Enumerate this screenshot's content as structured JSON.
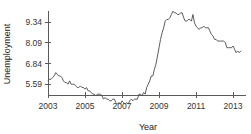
{
  "chart_data": {
    "type": "line",
    "title": "",
    "xlabel": "Year",
    "ylabel": "Unemployment",
    "xlim": [
      2003.0,
      2013.7
    ],
    "ylim": [
      4.95,
      9.95
    ],
    "grid": false,
    "legend": "none",
    "line_color": "#4a4a4a",
    "axis_color": "#5a5a5a",
    "background_color": "#ffffff",
    "y_ticks": [
      5.59,
      6.84,
      8.09,
      9.34
    ],
    "y_tick_labels": [
      "5.59",
      "6.84",
      "8.09",
      "9.34"
    ],
    "x_ticks": [
      2003,
      2005,
      2007,
      2009,
      2011,
      2013
    ],
    "x_tick_labels": [
      "2003",
      "2005",
      "2007",
      "2009",
      "2011",
      "2013"
    ],
    "series": [
      {
        "name": "Unemployment",
        "x": [
          2003.0,
          2003.083,
          2003.167,
          2003.25,
          2003.333,
          2003.417,
          2003.5,
          2003.583,
          2003.667,
          2003.75,
          2003.833,
          2003.917,
          2004.0,
          2004.083,
          2004.167,
          2004.25,
          2004.333,
          2004.417,
          2004.5,
          2004.583,
          2004.667,
          2004.75,
          2004.833,
          2004.917,
          2005.0,
          2005.083,
          2005.167,
          2005.25,
          2005.333,
          2005.417,
          2005.5,
          2005.583,
          2005.667,
          2005.75,
          2005.833,
          2005.917,
          2006.0,
          2006.083,
          2006.167,
          2006.25,
          2006.333,
          2006.417,
          2006.5,
          2006.583,
          2006.667,
          2006.75,
          2006.833,
          2006.917,
          2007.0,
          2007.083,
          2007.167,
          2007.25,
          2007.333,
          2007.417,
          2007.5,
          2007.583,
          2007.667,
          2007.75,
          2007.833,
          2007.917,
          2008.0,
          2008.083,
          2008.167,
          2008.25,
          2008.333,
          2008.417,
          2008.5,
          2008.583,
          2008.667,
          2008.75,
          2008.833,
          2008.917,
          2009.0,
          2009.083,
          2009.167,
          2009.25,
          2009.333,
          2009.417,
          2009.5,
          2009.583,
          2009.667,
          2009.75,
          2009.833,
          2009.917,
          2010.0,
          2010.083,
          2010.167,
          2010.25,
          2010.333,
          2010.417,
          2010.5,
          2010.583,
          2010.667,
          2010.75,
          2010.833,
          2010.917,
          2011.0,
          2011.083,
          2011.167,
          2011.25,
          2011.333,
          2011.417,
          2011.5,
          2011.583,
          2011.667,
          2011.75,
          2011.833,
          2011.917,
          2012.0,
          2012.083,
          2012.167,
          2012.25,
          2012.333,
          2012.417,
          2012.5,
          2012.583,
          2012.667,
          2012.75,
          2012.833,
          2012.917,
          2013.0,
          2013.083,
          2013.167,
          2013.25,
          2013.333,
          2013.417
        ],
        "values": [
          5.8,
          5.9,
          5.9,
          6.0,
          6.1,
          6.3,
          6.2,
          6.1,
          6.1,
          6.0,
          5.8,
          5.7,
          5.7,
          5.6,
          5.8,
          5.6,
          5.6,
          5.6,
          5.5,
          5.4,
          5.4,
          5.5,
          5.4,
          5.4,
          5.3,
          5.4,
          5.2,
          5.2,
          5.1,
          5.0,
          5.0,
          4.9,
          5.0,
          5.0,
          5.0,
          4.9,
          4.7,
          4.8,
          4.7,
          4.7,
          4.6,
          4.6,
          4.7,
          4.7,
          4.5,
          4.4,
          4.5,
          4.4,
          4.6,
          4.5,
          4.4,
          4.5,
          4.4,
          4.6,
          4.7,
          4.6,
          4.7,
          4.7,
          4.7,
          5.0,
          5.0,
          4.9,
          5.1,
          5.0,
          5.4,
          5.6,
          5.8,
          6.1,
          6.1,
          6.5,
          6.8,
          7.3,
          7.8,
          8.3,
          8.7,
          9.0,
          9.4,
          9.5,
          9.5,
          9.6,
          9.8,
          10.0,
          9.9,
          9.9,
          9.8,
          9.8,
          9.9,
          9.9,
          9.6,
          9.4,
          9.4,
          9.5,
          9.5,
          9.4,
          9.8,
          9.3,
          9.1,
          9.0,
          8.9,
          9.0,
          9.0,
          9.1,
          9.0,
          9.0,
          9.0,
          8.8,
          8.6,
          8.5,
          8.3,
          8.3,
          8.2,
          8.2,
          8.2,
          8.2,
          8.2,
          8.1,
          7.8,
          7.8,
          7.8,
          7.8,
          7.9,
          7.7,
          7.5,
          7.6,
          7.5,
          7.6
        ]
      }
    ]
  }
}
